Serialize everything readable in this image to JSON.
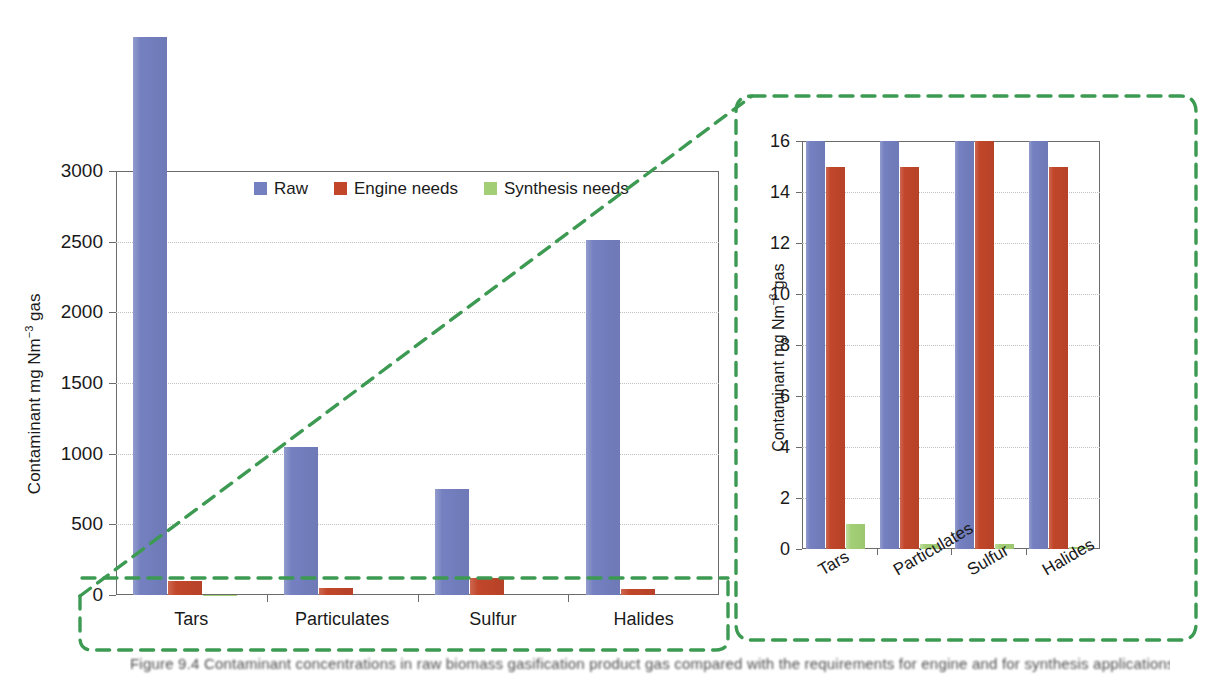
{
  "figure": {
    "title": "",
    "caption_text": "Figure 9.4  Contaminant concentrations in raw biomass gasification product gas compared with the requirements for engine and for synthesis applications."
  },
  "legend": {
    "position": "top-center-inside-main-panel",
    "entries": [
      {
        "label": "Raw",
        "color": "#7480c0",
        "key": "raw"
      },
      {
        "label": "Engine needs",
        "color": "#c1462a",
        "key": "engine"
      },
      {
        "label": "Synthesis needs",
        "color": "#a2cf75",
        "key": "synthesis"
      }
    ]
  },
  "callout": {
    "color": "#3c9a52",
    "style": "dashed",
    "description": "dashed green magnifier bracket linking the near-zero region of the main chart to the inset chart"
  },
  "main_panel": {
    "ylabel": "Contaminant mg Nm−3 gas",
    "ylabel_parts": {
      "text": "Contaminant mg Nm",
      "sup": "−3",
      "tail": " gas"
    },
    "ytick_labels": [
      "0",
      "500",
      "1000",
      "1500",
      "2000",
      "2500",
      "3000"
    ],
    "xtick_labels": [
      "Tars",
      "Particulates",
      "Sulfur",
      "Halides"
    ]
  },
  "inset_panel": {
    "ylabel": "Contaminant mg Nm−3 gas",
    "ylabel_parts": {
      "text": "Contaminant mg Nm",
      "sup": "−3",
      "tail": " gas"
    },
    "ytick_labels": [
      "0",
      "2",
      "4",
      "6",
      "8",
      "10",
      "12",
      "14",
      "16"
    ],
    "xtick_labels": [
      "Tars",
      "Particulates",
      "Sulfur",
      "Halides"
    ]
  },
  "chart_data": [
    {
      "id": "main",
      "type": "bar",
      "title": "",
      "xlabel": "",
      "ylabel": "Contaminant mg Nm-3 gas",
      "categories": [
        "Tars",
        "Particulates",
        "Sulfur",
        "Halides"
      ],
      "ylim": [
        0,
        3000
      ],
      "ytick_step": 500,
      "yticks": [
        0,
        500,
        1000,
        1500,
        2000,
        2500,
        3000
      ],
      "grid": "horizontal-dotted",
      "legend_position": "inside top center",
      "notes": "Raw Tars bar is clipped by the axis top and drawn overflowing above the 3000 frame (~4000 mg/Nm3). Engine-needs bars are near zero at this scale; synthesis-needs bars are invisible at this scale.",
      "series": [
        {
          "name": "Raw",
          "color": "#7480c0",
          "values": [
            4000,
            1050,
            750,
            2510
          ],
          "overflow_above_axis": [
            true,
            false,
            false,
            false
          ]
        },
        {
          "name": "Engine needs",
          "color": "#c1462a",
          "values": [
            100,
            50,
            120,
            40
          ]
        },
        {
          "name": "Synthesis needs",
          "color": "#a2cf75",
          "values": [
            1,
            0.2,
            0.2,
            0.02
          ]
        }
      ]
    },
    {
      "id": "inset",
      "type": "bar",
      "title": "",
      "xlabel": "",
      "ylabel": "Contaminant mg Nm-3 gas",
      "categories": [
        "Tars",
        "Particulates",
        "Sulfur",
        "Halides"
      ],
      "ylim": [
        0,
        16
      ],
      "ytick_step": 2,
      "yticks": [
        0,
        2,
        4,
        6,
        8,
        10,
        12,
        14,
        16
      ],
      "grid": "horizontal-dotted",
      "legend_position": "none",
      "notes": "Magnified view of the near-zero region. Raw bars are clipped at the 16 axis maximum for all four contaminants. Engine-needs bars reach 15 for Tars, Particulates and Halides and are clipped at 16 for Sulfur.",
      "series": [
        {
          "name": "Raw",
          "color": "#7480c0",
          "values": [
            16,
            16,
            16,
            16
          ],
          "clipped_at_axis_max": [
            true,
            true,
            true,
            true
          ]
        },
        {
          "name": "Engine needs",
          "color": "#c1462a",
          "values": [
            15,
            15,
            16,
            15
          ],
          "clipped_at_axis_max": [
            false,
            false,
            true,
            false
          ]
        },
        {
          "name": "Synthesis needs",
          "color": "#a2cf75",
          "values": [
            1.0,
            0.2,
            0.2,
            0.05
          ]
        }
      ]
    }
  ]
}
